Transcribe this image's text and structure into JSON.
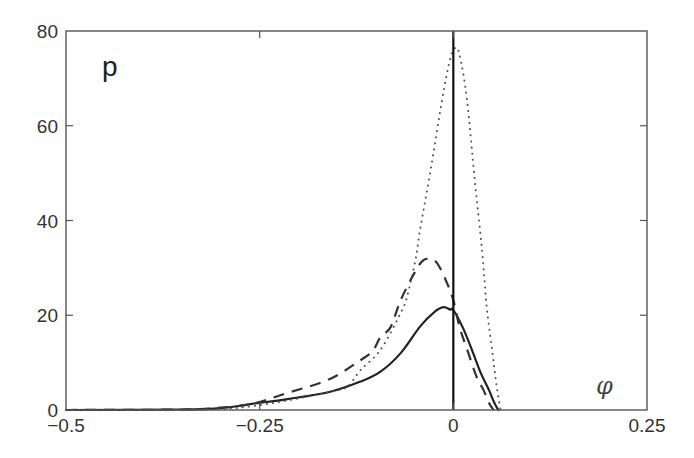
{
  "chart_data": {
    "type": "line",
    "title": "",
    "panel_label": "p",
    "xlabel": "φ",
    "ylabel": "",
    "xlim": [
      -0.5,
      0.25
    ],
    "ylim": [
      0,
      80
    ],
    "grid": false,
    "legend": null,
    "x_ticks": [
      {
        "value": -0.5,
        "label": "−0.5"
      },
      {
        "value": -0.25,
        "label": "−0.25"
      },
      {
        "value": 0,
        "label": "0"
      },
      {
        "value": 0.25,
        "label": "0.25"
      }
    ],
    "y_ticks": [
      {
        "value": 0,
        "label": "0"
      },
      {
        "value": 20,
        "label": "20"
      },
      {
        "value": 40,
        "label": "40"
      },
      {
        "value": 60,
        "label": "60"
      },
      {
        "value": 80,
        "label": "80"
      }
    ],
    "annotations": [
      {
        "type": "vline",
        "x": 0,
        "style": "solid"
      }
    ],
    "series": [
      {
        "name": "solid",
        "style": "solid",
        "color": "#222222",
        "x": [
          -0.5,
          -0.35,
          -0.3,
          -0.26,
          -0.214,
          -0.16,
          -0.12,
          -0.094,
          -0.068,
          -0.043,
          -0.025,
          -0.013,
          -0.004,
          0.0,
          0.012,
          0.024,
          0.035,
          0.046,
          0.053,
          0.058
        ],
        "y": [
          0,
          0.1,
          0.4,
          1.3,
          2.3,
          3.8,
          6.0,
          8.1,
          12.0,
          17.6,
          20.6,
          21.7,
          21.2,
          21.1,
          17.5,
          12.7,
          8.0,
          4.2,
          1.5,
          0
        ]
      },
      {
        "name": "dashed",
        "style": "dashed",
        "color": "#333333",
        "x": [
          -0.5,
          -0.35,
          -0.3,
          -0.26,
          -0.214,
          -0.16,
          -0.12,
          -0.104,
          -0.094,
          -0.081,
          -0.068,
          -0.05,
          -0.039,
          -0.03,
          -0.021,
          -0.01,
          0.0,
          0.008,
          0.018,
          0.03,
          0.039,
          0.046,
          0.052
        ],
        "y": [
          0,
          0.1,
          0.5,
          1.3,
          3.6,
          6.5,
          10.5,
          12.5,
          15.4,
          17.5,
          23.2,
          29.0,
          31.6,
          31.8,
          31.0,
          27.5,
          23.2,
          17.5,
          12.7,
          7.0,
          4.2,
          1.5,
          0
        ]
      },
      {
        "name": "dotted",
        "style": "dotted",
        "color": "#555555",
        "x": [
          -0.5,
          -0.35,
          -0.3,
          -0.26,
          -0.214,
          -0.16,
          -0.137,
          -0.12,
          -0.094,
          -0.068,
          -0.06,
          -0.049,
          -0.043,
          -0.03,
          -0.0146,
          -0.005,
          0.002,
          0.008,
          0.0177,
          0.028,
          0.037,
          0.043,
          0.05,
          0.056,
          0.061
        ],
        "y": [
          0,
          0.05,
          0.2,
          0.8,
          2.0,
          3.8,
          4.9,
          8.4,
          12.7,
          20.5,
          23.8,
          31.6,
          38.0,
          50.0,
          65.4,
          73.5,
          76.4,
          75.0,
          65.4,
          48.0,
          33.8,
          22.0,
          12.7,
          5.0,
          0
        ]
      }
    ]
  }
}
